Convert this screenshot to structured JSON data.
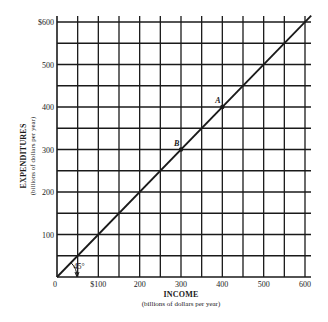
{
  "chart_data": {
    "type": "line",
    "title": "",
    "xlabel": "INCOME",
    "xlabel_sub": "(billions of dollars per year)",
    "ylabel": "EXPENDITURES",
    "ylabel_sub": "(billions of dollars per year)",
    "xlim": [
      0,
      600
    ],
    "ylim": [
      0,
      600
    ],
    "grid": true,
    "grid_step": 50,
    "x_ticks": [
      {
        "value": 0,
        "label": "0"
      },
      {
        "value": 100,
        "label": "$100"
      },
      {
        "value": 200,
        "label": "200"
      },
      {
        "value": 300,
        "label": "300"
      },
      {
        "value": 400,
        "label": "400"
      },
      {
        "value": 500,
        "label": "500"
      },
      {
        "value": 600,
        "label": "600"
      }
    ],
    "y_ticks": [
      {
        "value": 100,
        "label": "100"
      },
      {
        "value": 200,
        "label": "200"
      },
      {
        "value": 300,
        "label": "300"
      },
      {
        "value": 400,
        "label": "400"
      },
      {
        "value": 500,
        "label": "500"
      },
      {
        "value": 600,
        "label": "$600"
      }
    ],
    "series": [
      {
        "name": "45-degree line (expenditures = income)",
        "x": [
          0,
          600
        ],
        "y": [
          0,
          600
        ]
      }
    ],
    "points": [
      {
        "label": "A",
        "x": 400,
        "y": 400
      },
      {
        "label": "B",
        "x": 300,
        "y": 300
      }
    ],
    "annotations": [
      {
        "text": "45°",
        "x": 40,
        "y": 20
      }
    ],
    "legend": null
  }
}
